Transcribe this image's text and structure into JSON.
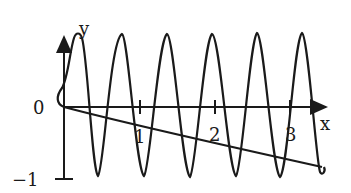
{
  "diagram": {
    "type": "function-graph",
    "axes": {
      "x_label": "x",
      "y_label": "y",
      "origin_label": "0",
      "x_ticks": [
        "1",
        "2",
        "3"
      ],
      "y_ticks": [
        "−1"
      ]
    },
    "curves": [
      {
        "name": "oscillating-curve",
        "description": "high-frequency oscillation between about 1 and −1, starting at origin with a small bulge left of the y-axis"
      },
      {
        "name": "descending-curve",
        "description": "slowly decreasing curve from origin to about −0.8 at x≈3.4"
      }
    ],
    "colors": {
      "stroke": "#1a1a1a",
      "background": "#ffffff"
    }
  }
}
